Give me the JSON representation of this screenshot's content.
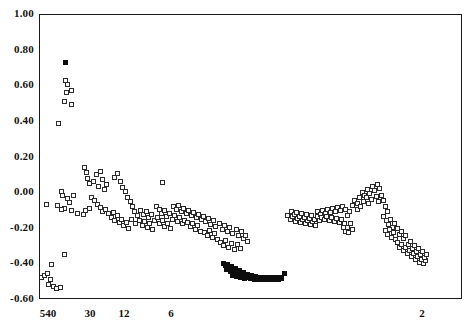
{
  "chart_data": {
    "type": "scatter",
    "title": "",
    "xlabel": "",
    "ylabel": "",
    "ylim": [
      -0.6,
      1.0
    ],
    "yticks": [
      1.0,
      0.8,
      0.6,
      0.4,
      0.2,
      0.0,
      -0.2,
      -0.4,
      -0.6
    ],
    "ytick_labels": [
      "1.00",
      "0.80",
      "0.60",
      "0.40",
      "0.20",
      "0.00",
      "-0.20",
      "-0.40",
      "-0.60"
    ],
    "xtick_labels": [
      "540",
      "30",
      "12",
      "6",
      "2"
    ],
    "xtick_positions_px": [
      48,
      90,
      124,
      171,
      422
    ],
    "grid": false,
    "legend": null,
    "marker_colors": {
      "open_square_edge": "#2b2b2b",
      "open_square_fill": "#ffffff",
      "filled_square": "#0d0d0d"
    },
    "axis_color": "#1a1a1a",
    "series": [
      {
        "name": "open-squares",
        "marker": "open square",
        "points_px": [
          [
            64,
            79
          ],
          [
            66,
            83
          ],
          [
            65,
            91
          ],
          [
            70,
            89
          ],
          [
            63,
            100
          ],
          [
            70,
            103
          ],
          [
            57,
            122
          ],
          [
            60,
            190
          ],
          [
            61,
            194
          ],
          [
            66,
            197
          ],
          [
            72,
            194
          ],
          [
            68,
            201
          ],
          [
            63,
            207
          ],
          [
            70,
            209
          ],
          [
            76,
            212
          ],
          [
            45,
            203
          ],
          [
            56,
            204
          ],
          [
            60,
            208
          ],
          [
            40,
            276
          ],
          [
            43,
            274
          ],
          [
            46,
            272
          ],
          [
            49,
            278
          ],
          [
            47,
            283
          ],
          [
            52,
            285
          ],
          [
            55,
            287
          ],
          [
            59,
            286
          ],
          [
            50,
            263
          ],
          [
            63,
            253
          ],
          [
            83,
            166
          ],
          [
            85,
            171
          ],
          [
            86,
            177
          ],
          [
            88,
            182
          ],
          [
            92,
            180
          ],
          [
            95,
            173
          ],
          [
            97,
            185
          ],
          [
            99,
            170
          ],
          [
            101,
            178
          ],
          [
            103,
            188
          ],
          [
            105,
            183
          ],
          [
            90,
            196
          ],
          [
            93,
            199
          ],
          [
            96,
            203
          ],
          [
            99,
            206
          ],
          [
            101,
            210
          ],
          [
            104,
            208
          ],
          [
            107,
            212
          ],
          [
            88,
            207
          ],
          [
            84,
            209
          ],
          [
            82,
            213
          ],
          [
            110,
            216
          ],
          [
            112,
            211
          ],
          [
            113,
            219
          ],
          [
            116,
            214
          ],
          [
            118,
            221
          ],
          [
            120,
            218
          ],
          [
            122,
            224
          ],
          [
            125,
            221
          ],
          [
            127,
            227
          ],
          [
            113,
            176
          ],
          [
            116,
            172
          ],
          [
            119,
            180
          ],
          [
            121,
            186
          ],
          [
            124,
            190
          ],
          [
            126,
            196
          ],
          [
            129,
            200
          ],
          [
            131,
            205
          ],
          [
            133,
            210
          ],
          [
            136,
            214
          ],
          [
            130,
            218
          ],
          [
            134,
            222
          ],
          [
            138,
            219
          ],
          [
            141,
            224
          ],
          [
            143,
            220
          ],
          [
            146,
            226
          ],
          [
            148,
            222
          ],
          [
            151,
            228
          ],
          [
            139,
            209
          ],
          [
            142,
            213
          ],
          [
            145,
            210
          ],
          [
            147,
            216
          ],
          [
            150,
            213
          ],
          [
            153,
            219
          ],
          [
            156,
            216
          ],
          [
            158,
            222
          ],
          [
            161,
            219
          ],
          [
            163,
            225
          ],
          [
            166,
            222
          ],
          [
            169,
            227
          ],
          [
            155,
            205
          ],
          [
            158,
            208
          ],
          [
            160,
            212
          ],
          [
            163,
            209
          ],
          [
            165,
            215
          ],
          [
            168,
            212
          ],
          [
            171,
            218
          ],
          [
            173,
            214
          ],
          [
            176,
            220
          ],
          [
            178,
            216
          ],
          [
            181,
            222
          ],
          [
            183,
            219
          ],
          [
            172,
            205
          ],
          [
            175,
            208
          ],
          [
            177,
            204
          ],
          [
            180,
            210
          ],
          [
            182,
            207
          ],
          [
            185,
            212
          ],
          [
            187,
            209
          ],
          [
            190,
            214
          ],
          [
            192,
            211
          ],
          [
            195,
            216
          ],
          [
            197,
            213
          ],
          [
            200,
            218
          ],
          [
            186,
            221
          ],
          [
            189,
            225
          ],
          [
            191,
            222
          ],
          [
            194,
            228
          ],
          [
            196,
            224
          ],
          [
            199,
            230
          ],
          [
            202,
            215
          ],
          [
            204,
            220
          ],
          [
            207,
            217
          ],
          [
            209,
            223
          ],
          [
            212,
            219
          ],
          [
            214,
            225
          ],
          [
            203,
            231
          ],
          [
            206,
            234
          ],
          [
            208,
            229
          ],
          [
            211,
            236
          ],
          [
            213,
            232
          ],
          [
            216,
            238
          ],
          [
            218,
            222
          ],
          [
            221,
            228
          ],
          [
            223,
            224
          ],
          [
            226,
            230
          ],
          [
            228,
            226
          ],
          [
            231,
            232
          ],
          [
            219,
            241
          ],
          [
            222,
            244
          ],
          [
            224,
            239
          ],
          [
            227,
            246
          ],
          [
            230,
            242
          ],
          [
            233,
            248
          ],
          [
            235,
            228
          ],
          [
            237,
            234
          ],
          [
            240,
            230
          ],
          [
            242,
            237
          ],
          [
            236,
            243
          ],
          [
            239,
            247
          ],
          [
            244,
            234
          ],
          [
            246,
            240
          ],
          [
            161,
            181
          ],
          [
            286,
            214
          ],
          [
            289,
            218
          ],
          [
            291,
            215
          ],
          [
            294,
            220
          ],
          [
            296,
            217
          ],
          [
            299,
            221
          ],
          [
            301,
            218
          ],
          [
            304,
            222
          ],
          [
            306,
            219
          ],
          [
            309,
            223
          ],
          [
            311,
            220
          ],
          [
            314,
            224
          ],
          [
            290,
            210
          ],
          [
            293,
            213
          ],
          [
            295,
            211
          ],
          [
            298,
            215
          ],
          [
            300,
            212
          ],
          [
            303,
            216
          ],
          [
            305,
            213
          ],
          [
            308,
            217
          ],
          [
            310,
            214
          ],
          [
            313,
            218
          ],
          [
            316,
            215
          ],
          [
            318,
            219
          ],
          [
            316,
            210
          ],
          [
            319,
            213
          ],
          [
            321,
            209
          ],
          [
            324,
            212
          ],
          [
            326,
            208
          ],
          [
            329,
            211
          ],
          [
            331,
            207
          ],
          [
            334,
            210
          ],
          [
            336,
            206
          ],
          [
            339,
            209
          ],
          [
            341,
            205
          ],
          [
            344,
            208
          ],
          [
            320,
            216
          ],
          [
            323,
            218
          ],
          [
            325,
            215
          ],
          [
            328,
            219
          ],
          [
            330,
            216
          ],
          [
            333,
            220
          ],
          [
            335,
            217
          ],
          [
            338,
            221
          ],
          [
            340,
            218
          ],
          [
            343,
            222
          ],
          [
            346,
            214
          ],
          [
            348,
            210
          ],
          [
            351,
            204
          ],
          [
            353,
            199
          ],
          [
            356,
            202
          ],
          [
            358,
            196
          ],
          [
            361,
            191
          ],
          [
            363,
            194
          ],
          [
            366,
            188
          ],
          [
            368,
            192
          ],
          [
            371,
            185
          ],
          [
            373,
            189
          ],
          [
            376,
            183
          ],
          [
            378,
            187
          ],
          [
            356,
            208
          ],
          [
            359,
            205
          ],
          [
            362,
            200
          ],
          [
            365,
            196
          ],
          [
            367,
            202
          ],
          [
            370,
            198
          ],
          [
            375,
            195
          ],
          [
            377,
            200
          ],
          [
            380,
            194
          ],
          [
            382,
            199
          ],
          [
            384,
            205
          ],
          [
            386,
            210
          ],
          [
            382,
            215
          ],
          [
            385,
            219
          ],
          [
            387,
            223
          ],
          [
            389,
            218
          ],
          [
            391,
            226
          ],
          [
            393,
            222
          ],
          [
            384,
            229
          ],
          [
            386,
            233
          ],
          [
            388,
            228
          ],
          [
            390,
            236
          ],
          [
            392,
            231
          ],
          [
            394,
            238
          ],
          [
            396,
            227
          ],
          [
            398,
            233
          ],
          [
            400,
            230
          ],
          [
            402,
            237
          ],
          [
            404,
            234
          ],
          [
            396,
            241
          ],
          [
            398,
            246
          ],
          [
            400,
            243
          ],
          [
            402,
            249
          ],
          [
            404,
            246
          ],
          [
            406,
            252
          ],
          [
            408,
            249
          ],
          [
            410,
            255
          ],
          [
            412,
            252
          ],
          [
            414,
            258
          ],
          [
            416,
            255
          ],
          [
            418,
            261
          ],
          [
            420,
            258
          ],
          [
            422,
            262
          ],
          [
            424,
            259
          ],
          [
            407,
            243
          ],
          [
            409,
            240
          ],
          [
            411,
            247
          ],
          [
            413,
            244
          ],
          [
            415,
            250
          ],
          [
            417,
            247
          ],
          [
            419,
            253
          ],
          [
            421,
            250
          ],
          [
            423,
            256
          ],
          [
            425,
            253
          ],
          [
            349,
            222
          ],
          [
            346,
            226
          ],
          [
            344,
            230
          ],
          [
            342,
            226
          ],
          [
            347,
            231
          ],
          [
            351,
            228
          ]
        ]
      },
      {
        "name": "filled-squares",
        "marker": "filled square",
        "points_px": [
          [
            64,
            61
          ],
          [
            222,
            262
          ],
          [
            224,
            264
          ],
          [
            226,
            263
          ],
          [
            228,
            266
          ],
          [
            230,
            265
          ],
          [
            232,
            268
          ],
          [
            234,
            267
          ],
          [
            236,
            270
          ],
          [
            238,
            269
          ],
          [
            240,
            272
          ],
          [
            242,
            271
          ],
          [
            244,
            274
          ],
          [
            246,
            273
          ],
          [
            248,
            275
          ],
          [
            250,
            274
          ],
          [
            252,
            276
          ],
          [
            254,
            275
          ],
          [
            256,
            277
          ],
          [
            258,
            276
          ],
          [
            260,
            277
          ],
          [
            262,
            276
          ],
          [
            264,
            277
          ],
          [
            266,
            276
          ],
          [
            268,
            277
          ],
          [
            270,
            276
          ],
          [
            272,
            277
          ],
          [
            274,
            276
          ],
          [
            276,
            277
          ],
          [
            278,
            276
          ],
          [
            280,
            277
          ],
          [
            225,
            268
          ],
          [
            229,
            270
          ],
          [
            233,
            272
          ],
          [
            237,
            273
          ],
          [
            241,
            275
          ],
          [
            245,
            276
          ],
          [
            249,
            277
          ],
          [
            253,
            278
          ],
          [
            257,
            278
          ],
          [
            261,
            278
          ],
          [
            265,
            278
          ],
          [
            269,
            278
          ],
          [
            273,
            278
          ],
          [
            277,
            278
          ],
          [
            231,
            274
          ],
          [
            235,
            275
          ],
          [
            239,
            276
          ],
          [
            243,
            277
          ],
          [
            283,
            272
          ]
        ]
      }
    ]
  }
}
